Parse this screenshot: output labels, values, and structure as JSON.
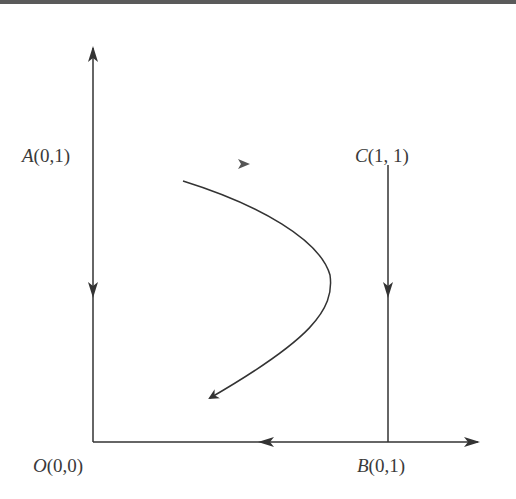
{
  "diagram": {
    "type": "phase-portrait",
    "line_color": "#333333",
    "points": {
      "A": {
        "letter": "A",
        "coords": "(0,1)"
      },
      "C": {
        "letter": "C",
        "coords": "(1, 1)"
      },
      "O": {
        "letter": "O",
        "coords": "(0,0)"
      },
      "B": {
        "letter": "B",
        "coords": "(0,1)"
      }
    },
    "edges": [
      {
        "from": "O",
        "to": "A",
        "direction": "both: upward beyond A, downward below A"
      },
      {
        "from": "C",
        "to": "B",
        "direction": "downward"
      },
      {
        "from": "B",
        "to": "O",
        "direction": "leftward; also rightward beyond B"
      }
    ],
    "trajectory": {
      "shape": "parabolic curve bending right then returning down-left",
      "direction": "toward lower-left"
    }
  }
}
